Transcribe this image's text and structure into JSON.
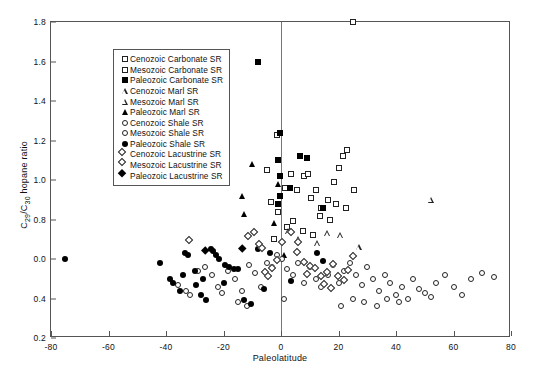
{
  "chart_data": {
    "type": "scatter",
    "title": "",
    "xlabel": "Paleolatitude",
    "ylabel": "C29/C30 hopane ratio",
    "ylabel_parts": {
      "pre": "C",
      "sub1": "29",
      "mid": "/C",
      "sub2": "30",
      "post": " hopane ratio"
    },
    "xlim": [
      -80,
      80
    ],
    "ylim": [
      0.2,
      1.8
    ],
    "xticks": [
      "-80",
      "-60",
      "-40",
      "-20",
      "0",
      "20",
      "40",
      "60",
      "80"
    ],
    "xtick_values": [
      -80,
      -60,
      -40,
      -20,
      0,
      20,
      40,
      60,
      80
    ],
    "yticks": [
      "1.8",
      "1.6",
      "1.4",
      "1.2",
      "1.0",
      "0.8",
      "0.0",
      "0.4",
      "0.2"
    ],
    "ytick_values": [
      1.8,
      1.6,
      1.4,
      1.2,
      1.0,
      0.8,
      0.6,
      0.4,
      0.2
    ],
    "grid": false,
    "reference_line_x": 0,
    "legend_position": "top-left",
    "legend": [
      {
        "label": "Cenozoic Carbonate SR",
        "marker": "square-open"
      },
      {
        "label": "Mesozoic Carbonate SR",
        "marker": "square-open"
      },
      {
        "label": "Paleozoic Carbonate SR",
        "marker": "square-filled"
      },
      {
        "label": "Cenozoic Marl SR",
        "marker": "triangle-open"
      },
      {
        "label": "Mesozoic Marl SR",
        "marker": "triangle-open"
      },
      {
        "label": "Paleozoic Marl SR",
        "marker": "triangle-filled"
      },
      {
        "label": "Cenozoic Shale SR",
        "marker": "circle-open"
      },
      {
        "label": "Mesozoic Shale SR",
        "marker": "circle-open"
      },
      {
        "label": "Paleozoic Shale SR",
        "marker": "circle-filled"
      },
      {
        "label": "Cenozoic Lacustrine SR",
        "marker": "diamond-open"
      },
      {
        "label": "Mesozoic Lacustrine SR",
        "marker": "diamond-open"
      },
      {
        "label": "Paleozoic Lacustrine SR",
        "marker": "diamond-filled"
      }
    ],
    "series": [
      {
        "name": "Carbonate SR (open square)",
        "marker": "square-open",
        "points": [
          [
            25.0,
            1.8
          ],
          [
            -1.5,
            1.23
          ],
          [
            -5.0,
            1.05
          ],
          [
            3.5,
            1.03
          ],
          [
            8.0,
            1.02
          ],
          [
            9.5,
            1.03
          ],
          [
            1.5,
            0.96
          ],
          [
            5.5,
            0.95
          ],
          [
            12.0,
            0.95
          ],
          [
            10.5,
            0.91
          ],
          [
            -3.5,
            0.89
          ],
          [
            16.5,
            0.9
          ],
          [
            14.0,
            0.86
          ],
          [
            -1.0,
            0.84
          ],
          [
            18.5,
            0.99
          ],
          [
            20.0,
            1.06
          ],
          [
            21.5,
            1.12
          ],
          [
            23.0,
            1.15
          ],
          [
            19.0,
            0.88
          ],
          [
            22.5,
            0.86
          ],
          [
            17.0,
            0.8
          ],
          [
            4.0,
            0.79
          ],
          [
            2.0,
            0.76
          ],
          [
            7.5,
            0.74
          ],
          [
            11.0,
            0.72
          ],
          [
            -2.5,
            0.7
          ],
          [
            13.5,
            0.82
          ],
          [
            25.5,
            0.95
          ]
        ]
      },
      {
        "name": "Paleozoic Carbonate SR (filled square)",
        "marker": "square-filled",
        "points": [
          [
            -8.0,
            1.6
          ],
          [
            -22.0,
            1.25
          ],
          [
            -0.5,
            1.24
          ],
          [
            -1.0,
            1.1
          ],
          [
            -0.5,
            1.02
          ],
          [
            -22.5,
            1.02
          ],
          [
            6.5,
            1.12
          ],
          [
            9.0,
            1.11
          ],
          [
            -0.5,
            0.92
          ],
          [
            -1.0,
            0.88
          ],
          [
            3.0,
            0.96
          ],
          [
            14.5,
            0.86
          ]
        ]
      },
      {
        "name": "Marl SR (open triangle)",
        "marker": "triangle-open",
        "points": [
          [
            52.0,
            0.9
          ],
          [
            20.5,
            0.72
          ],
          [
            27.0,
            0.66
          ],
          [
            12.5,
            0.68
          ],
          [
            16.0,
            0.73
          ],
          [
            2.5,
            0.74
          ],
          [
            6.0,
            0.7
          ]
        ]
      },
      {
        "name": "Paleozoic Marl SR (filled triangle)",
        "marker": "triangle-filled",
        "points": [
          [
            -10.0,
            1.08
          ],
          [
            -13.5,
            0.92
          ],
          [
            -13.0,
            0.83
          ],
          [
            -2.5,
            0.78
          ],
          [
            -1.0,
            0.98
          ],
          [
            1.0,
            0.62
          ]
        ]
      },
      {
        "name": "Shale SR (open circle)",
        "marker": "circle-open",
        "points": [
          [
            -36.0,
            0.47
          ],
          [
            -33.0,
            0.44
          ],
          [
            -31.5,
            0.42
          ],
          [
            -29.0,
            0.54
          ],
          [
            -26.5,
            0.56
          ],
          [
            -24.0,
            0.52
          ],
          [
            -22.0,
            0.46
          ],
          [
            -20.5,
            0.43
          ],
          [
            -18.5,
            0.54
          ],
          [
            -16.0,
            0.5
          ],
          [
            -13.5,
            0.44
          ],
          [
            -11.0,
            0.57
          ],
          [
            -9.0,
            0.53
          ],
          [
            -7.0,
            0.46
          ],
          [
            -5.0,
            0.58
          ],
          [
            -3.0,
            0.56
          ],
          [
            -1.5,
            0.62
          ],
          [
            0.5,
            0.6
          ],
          [
            2.0,
            0.55
          ],
          [
            4.0,
            0.52
          ],
          [
            6.0,
            0.58
          ],
          [
            8.0,
            0.48
          ],
          [
            10.0,
            0.56
          ],
          [
            12.0,
            0.5
          ],
          [
            14.0,
            0.46
          ],
          [
            16.5,
            0.52
          ],
          [
            18.0,
            0.57
          ],
          [
            20.0,
            0.48
          ],
          [
            22.0,
            0.54
          ],
          [
            24.0,
            0.58
          ],
          [
            26.0,
            0.52
          ],
          [
            28.0,
            0.47
          ],
          [
            30.0,
            0.56
          ],
          [
            32.0,
            0.5
          ],
          [
            34.0,
            0.44
          ],
          [
            36.0,
            0.52
          ],
          [
            38.0,
            0.48
          ],
          [
            40.0,
            0.42
          ],
          [
            42.0,
            0.46
          ],
          [
            44.0,
            0.4
          ],
          [
            46.0,
            0.5
          ],
          [
            48.0,
            0.45
          ],
          [
            50.0,
            0.43
          ],
          [
            52.0,
            0.41
          ],
          [
            54.0,
            0.48
          ],
          [
            57.0,
            0.52
          ],
          [
            60.0,
            0.46
          ],
          [
            63.0,
            0.42
          ],
          [
            66.0,
            0.5
          ],
          [
            70.0,
            0.53
          ],
          [
            74.0,
            0.51
          ],
          [
            29.0,
            0.38
          ],
          [
            33.5,
            0.36
          ],
          [
            37.0,
            0.4
          ],
          [
            41.0,
            0.38
          ],
          [
            21.0,
            0.36
          ],
          [
            25.0,
            0.4
          ],
          [
            -15.0,
            0.38
          ],
          [
            -12.0,
            0.36
          ],
          [
            1.0,
            0.4
          ]
        ]
      },
      {
        "name": "Paleozoic Shale SR (filled circle)",
        "marker": "circle-filled",
        "points": [
          [
            -75.0,
            0.6
          ],
          [
            -42.0,
            0.58
          ],
          [
            -38.5,
            0.5
          ],
          [
            -37.5,
            0.48
          ],
          [
            -35.0,
            0.44
          ],
          [
            -33.5,
            0.63
          ],
          [
            -32.5,
            0.62
          ],
          [
            -30.0,
            0.54
          ],
          [
            -28.0,
            0.42
          ],
          [
            -26.0,
            0.39
          ],
          [
            -24.5,
            0.65
          ],
          [
            -23.5,
            0.64
          ],
          [
            -22.5,
            0.62
          ],
          [
            -21.5,
            0.6
          ],
          [
            -19.5,
            0.57
          ],
          [
            -18.0,
            0.56
          ],
          [
            -16.5,
            0.55
          ],
          [
            -15.0,
            0.55
          ],
          [
            -13.0,
            0.39
          ],
          [
            -10.5,
            0.37
          ],
          [
            -27.0,
            0.5
          ],
          [
            -20.0,
            0.48
          ],
          [
            -8.0,
            0.65
          ],
          [
            12.5,
            0.63
          ],
          [
            14.5,
            0.59
          ],
          [
            3.5,
            0.49
          ],
          [
            -6.0,
            0.45
          ],
          [
            -4.0,
            0.63
          ],
          [
            -34.0,
            0.52
          ],
          [
            -29.5,
            0.47
          ]
        ]
      },
      {
        "name": "Lacustrine SR (open diamond)",
        "marker": "diamond-open",
        "points": [
          [
            -31.0,
            0.68
          ],
          [
            -8.5,
            0.72
          ],
          [
            -10.5,
            0.7
          ],
          [
            -4.5,
            0.52
          ],
          [
            -2.0,
            0.54
          ],
          [
            -3.5,
            0.5
          ],
          [
            4.5,
            0.72
          ],
          [
            6.5,
            0.62
          ],
          [
            9.0,
            0.57
          ],
          [
            11.0,
            0.55
          ],
          [
            10.0,
            0.51
          ],
          [
            13.0,
            0.54
          ],
          [
            15.0,
            0.5
          ],
          [
            17.0,
            0.52
          ],
          [
            19.0,
            0.56
          ],
          [
            21.0,
            0.5
          ],
          [
            23.0,
            0.48
          ],
          [
            24.5,
            0.53
          ],
          [
            -6.5,
            0.66
          ],
          [
            -5.5,
            0.64
          ],
          [
            1.5,
            0.67
          ],
          [
            7.0,
            0.67
          ],
          [
            16.0,
            0.46
          ],
          [
            18.5,
            0.44
          ],
          [
            26.0,
            0.6
          ],
          [
            -0.5,
            0.58
          ]
        ]
      },
      {
        "name": "Paleozoic Lacustrine SR (filled diamond)",
        "marker": "diamond-filled",
        "points": [
          [
            -25.5,
            0.63
          ],
          [
            -12.5,
            0.64
          ]
        ]
      }
    ]
  }
}
